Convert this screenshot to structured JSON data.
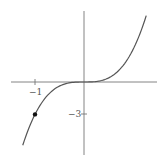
{
  "chart_data": {
    "type": "line",
    "title": "",
    "function": "y = 3x^3",
    "xlabel": "",
    "ylabel": "",
    "x_ticks": [
      {
        "value": -1,
        "label": "−1"
      }
    ],
    "y_ticks": [
      {
        "value": -3,
        "label": "−3"
      }
    ],
    "xlim": [
      -1.5,
      1.5
    ],
    "ylim": [
      -6.8,
      6.7
    ],
    "grid": false,
    "legend": null,
    "series": [
      {
        "name": "curve",
        "x": [
          -1.25,
          -1.0,
          -0.75,
          -0.5,
          -0.25,
          0,
          0.25,
          0.5,
          0.75,
          1.0,
          1.27
        ],
        "values": [
          -5.86,
          -3.0,
          -1.27,
          -0.375,
          -0.047,
          0,
          0.047,
          0.375,
          1.27,
          3.0,
          6.14
        ],
        "color": "#555555"
      }
    ],
    "highlighted_points": [
      {
        "x": -1,
        "y": -3,
        "color": "#111111"
      }
    ]
  },
  "labels": {
    "x_tick_neg1": "−1",
    "y_tick_neg3": "−3"
  }
}
